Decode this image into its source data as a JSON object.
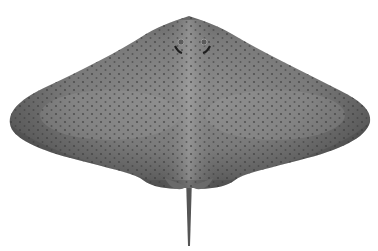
{
  "image": {
    "subject": "spotted ray illustration",
    "background_color": "#ffffff",
    "body_color": "#7a7a7a",
    "body_dark_color": "#4e4e4e",
    "highlight_color": "#a8a8a8",
    "spot_color": "#3c3c3c",
    "tail_color": "#555555"
  }
}
